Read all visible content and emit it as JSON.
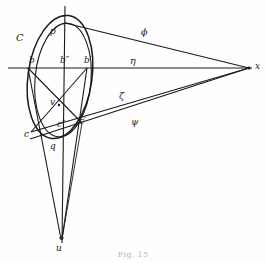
{
  "figure": {
    "caption": "Fig. 15",
    "background_color": "#fefefe",
    "stroke_color": "#1a1a1a",
    "labels": {
      "curve_C": "C",
      "apex_p": "p",
      "left_b": "b",
      "mid_b2": "b″",
      "right_b1": "b′",
      "center_v": "v",
      "left_c": "c",
      "mid_c2": "c″",
      "right_c1": "c′",
      "bottom_q": "q",
      "vertex_u": "u",
      "vanishing_x": "x",
      "ray_phi": "ϕ",
      "ray_eta": "η",
      "ray_zeta": "ζ",
      "ray_psi": "ψ"
    },
    "points": {
      "p": {
        "x": 65,
        "y": 23
      },
      "b": {
        "x": 28,
        "y": 68
      },
      "b2": {
        "x": 65,
        "y": 68
      },
      "b1": {
        "x": 87,
        "y": 68
      },
      "v": {
        "x": 59,
        "y": 105
      },
      "c": {
        "x": 31,
        "y": 132
      },
      "c2": {
        "x": 62,
        "y": 127
      },
      "c1": {
        "x": 82,
        "y": 123
      },
      "q": {
        "x": 65,
        "y": 143
      },
      "u": {
        "x": 61,
        "y": 239
      },
      "x": {
        "x": 249,
        "y": 68
      }
    },
    "ellipse": {
      "cx": 60,
      "cy": 77,
      "rx": 32,
      "ry": 62,
      "rotation_deg": 8
    },
    "ellipse_inner": {
      "cx": 63,
      "cy": 80,
      "rx": 28,
      "ry": 57,
      "rotation_deg": 5
    },
    "axes": {
      "horizontal_y": 68,
      "horizontal_x1": 8,
      "horizontal_x2": 252,
      "vertical_x": 65,
      "vertical_y1": 6,
      "vertical_y2": 243
    }
  }
}
